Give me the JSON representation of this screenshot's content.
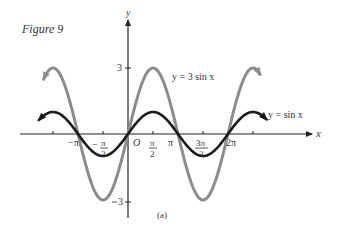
{
  "figure": {
    "title": "Figure 9",
    "caption": "(a)"
  },
  "chart_data": {
    "type": "line",
    "title": "Figure 9",
    "subtitle": "(a)",
    "xlabel": "x",
    "ylabel": "y",
    "x_ticks": [
      "−π",
      "−π/2",
      "O",
      "π/2",
      "π",
      "3π/2",
      "2π"
    ],
    "x_tick_values": [
      -3.1416,
      -1.5708,
      0,
      1.5708,
      3.1416,
      4.7124,
      6.2832
    ],
    "y_ticks": [
      "3",
      "−3"
    ],
    "y_tick_values": [
      3,
      -3
    ],
    "xlim": [
      -3.4,
      5.8
    ],
    "ylim": [
      -3.4,
      3.4
    ],
    "grid": false,
    "legend_position": "inline annotations",
    "series": [
      {
        "name": "y = 3 sin x",
        "color": "#8c8c8c",
        "function": "3*sin(x)",
        "x_range": [
          -5.3,
          8.3
        ],
        "amplitude": 3,
        "period": 6.2832,
        "points": [
          [
            -4.712,
            3
          ],
          [
            -3.1416,
            0
          ],
          [
            -1.5708,
            -3
          ],
          [
            0,
            0
          ],
          [
            1.5708,
            3
          ],
          [
            3.1416,
            0
          ],
          [
            4.7124,
            -3
          ],
          [
            6.2832,
            0
          ],
          [
            7.854,
            3
          ]
        ]
      },
      {
        "name": "y = sin x",
        "color": "#1a1a1a",
        "function": "sin(x)",
        "x_range": [
          -5.6,
          8.7
        ],
        "amplitude": 1,
        "period": 6.2832,
        "points": [
          [
            -4.712,
            1
          ],
          [
            -3.1416,
            0
          ],
          [
            -1.5708,
            -1
          ],
          [
            0,
            0
          ],
          [
            1.5708,
            1
          ],
          [
            3.1416,
            0
          ],
          [
            4.7124,
            -1
          ],
          [
            6.2832,
            0
          ],
          [
            7.854,
            1
          ]
        ]
      }
    ],
    "annotations": [
      {
        "text": "y = 3 sin x",
        "near": "series 1 peak at x=π/2"
      },
      {
        "text": "y = sin x",
        "near": "series 2 right end"
      }
    ]
  },
  "labels": {
    "x_axis": "x",
    "y_axis": "y",
    "origin": "O",
    "neg_pi": "−π",
    "neg_half_pi_num": "π",
    "neg_half_pi_sign": "−",
    "half_pi_num": "π",
    "den2": "2",
    "pi": "π",
    "three_half_pi_num": "3π",
    "two_pi": "2π",
    "y_three": "3",
    "y_neg_three": "3",
    "y_neg_sign": "−",
    "series1_label": "y = 3 sin x",
    "series2_label": "y = sin x"
  }
}
